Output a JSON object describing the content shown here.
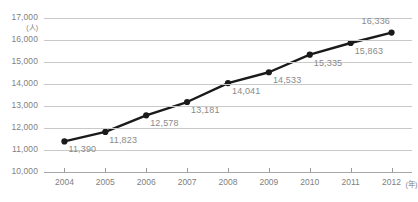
{
  "chart_data": {
    "type": "line",
    "title": "",
    "xlabel": "年",
    "ylabel": "人",
    "yunit_label": "(人)",
    "xunit_label": "(年)",
    "categories": [
      "2004",
      "2005",
      "2006",
      "2007",
      "2008",
      "2009",
      "2010",
      "2011",
      "2012"
    ],
    "values": [
      11390,
      11823,
      12578,
      13181,
      14041,
      14533,
      15335,
      15863,
      16336
    ],
    "point_labels": [
      "11,390",
      "11,823",
      "12,578",
      "13,181",
      "14,041",
      "14,533",
      "15,335",
      "15,863",
      "16,336"
    ],
    "ylim": [
      10000,
      17000
    ],
    "ytick_values": [
      10000,
      11000,
      12000,
      13000,
      14000,
      15000,
      16000,
      17000
    ],
    "ytick_labels": [
      "10,000",
      "11,000",
      "12,000",
      "13,000",
      "14,000",
      "15,000",
      "16,000",
      "17,000"
    ],
    "grid": true,
    "legend": "none",
    "series": [
      {
        "name": "",
        "values": [
          11390,
          11823,
          12578,
          13181,
          14041,
          14533,
          15335,
          15863,
          16336
        ],
        "line_color": "#1a1a1a",
        "marker": "circle",
        "marker_color": "#1a1a1a"
      }
    ],
    "colors": {
      "line": "#1a1a1a",
      "marker": "#1a1a1a",
      "grid": "#c9c9c9",
      "axis": "#a8a8a8",
      "tick_text": "#7f7f7f",
      "data_label": "#8a8a8a",
      "background": "#ffffff"
    }
  }
}
